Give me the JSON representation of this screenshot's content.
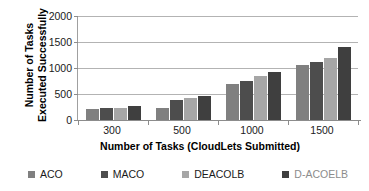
{
  "chart_data": {
    "type": "bar",
    "title": "",
    "xlabel": "Number of Tasks (CloudLets Submitted)",
    "ylabel": "Number of Tasks Executed Successfully",
    "ylabel_line1": "Number of Tasks",
    "ylabel_line2": "Executed Successfully",
    "categories": [
      "300",
      "500",
      "1000",
      "1500"
    ],
    "ylim": [
      0,
      2000
    ],
    "yticks": [
      "0",
      "500",
      "1000",
      "1500",
      "2000"
    ],
    "grid": "horizontal",
    "legend_position": "bottom",
    "series": [
      {
        "name": "ACO",
        "color": "#808080",
        "label_color": "#1a1a1a",
        "values": [
          210,
          225,
          700,
          1050
        ]
      },
      {
        "name": "MACO",
        "color": "#4d4d4d",
        "label_color": "#1a1a1a",
        "values": [
          225,
          385,
          745,
          1120
        ]
      },
      {
        "name": "DEACOLB",
        "color": "#a6a6a6",
        "label_color": "#1a1a1a",
        "values": [
          225,
          430,
          850,
          1195
        ]
      },
      {
        "name": "D-ACOELB",
        "color": "#3f3f3f",
        "label_color": "#8c8c8c",
        "values": [
          275,
          470,
          930,
          1410
        ]
      }
    ],
    "values_by_category": {
      "300": {
        "ACO": 210,
        "MACO": 225,
        "DEACOLB": 225,
        "D-ACOELB": 275
      },
      "500": {
        "ACO": 350,
        "MACO": 385,
        "DEACOLB": 430,
        "D-ACOELB": 470
      },
      "1000": {
        "ACO": 700,
        "MACO": 745,
        "DEACOLB": 850,
        "D-ACOELB": 930
      },
      "1500": {
        "ACO": 1050,
        "MACO": 1120,
        "DEACOLB": 1195,
        "D-ACOELB": 1410
      }
    }
  },
  "legend": {
    "items": [
      {
        "label": "ACO"
      },
      {
        "label": "MACO"
      },
      {
        "label": "DEACOLB"
      },
      {
        "label": "D-ACOELB"
      }
    ]
  },
  "colors": {
    "gridline": "#b3b3b3",
    "axis": "#8c8c8c",
    "background": "#ffffff",
    "text": "#1a1a1a"
  }
}
